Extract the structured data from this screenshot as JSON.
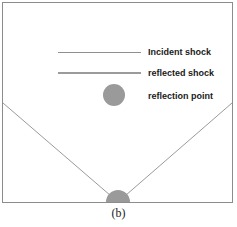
{
  "figure": {
    "caption": "(b)",
    "frame_color": "#8c8c8c",
    "background_color": "#ffffff"
  },
  "legend": {
    "items": [
      {
        "label": "Incident shock",
        "marker": "line",
        "color": "#8f8f8f"
      },
      {
        "label": "reflected shock",
        "marker": "line",
        "color": "#9b9b9b"
      },
      {
        "label": "reflection point",
        "marker": "circle",
        "color": "#9a9a9a"
      }
    ]
  },
  "diagram": {
    "incident_shock": {
      "name": "incident-shock-line",
      "x1": 3,
      "y1": 103,
      "x2": 118,
      "y2": 202,
      "color": "#8f8f8f"
    },
    "reflected_shock": {
      "name": "reflected-shock-line",
      "x1": 118,
      "y1": 202,
      "x2": 232,
      "y2": 103,
      "color": "#8f8f8f"
    },
    "reflection_point": {
      "name": "reflection-point-marker",
      "cx": 118,
      "cy": 202,
      "r": 12,
      "color": "#9a9a9a"
    },
    "ground_line": {
      "name": "ground-line",
      "y": 202,
      "color": "#8c8c8c"
    }
  }
}
